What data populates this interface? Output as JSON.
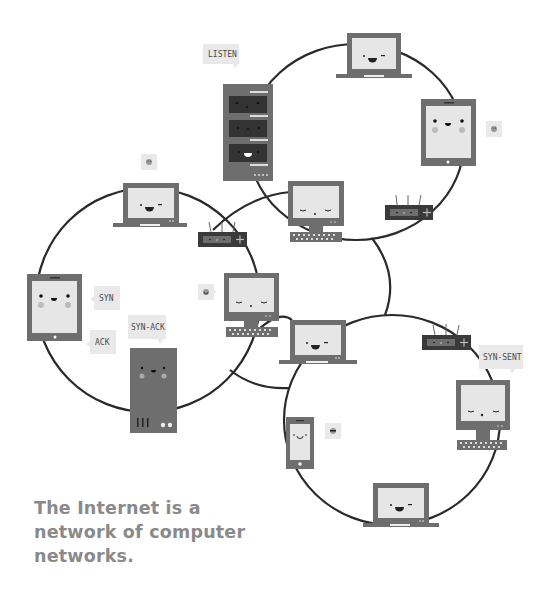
{
  "caption": {
    "lines": [
      "The Internet is a",
      "network of computer",
      "networks."
    ]
  },
  "labels": {
    "listen": "LISTEN",
    "syn": "SYN",
    "ack": "ACK",
    "syn_ack": "SYN-ACK",
    "syn_sent": "SYN-SENT"
  },
  "colors": {
    "device_body": "#6e6e6e",
    "screen": "#e6e6e6",
    "dark": "#3a3a3a",
    "line": "#2a2a2a",
    "bubble": "#e9e9e9",
    "cheek": "#b9b9b9",
    "text": "#8a8a8a"
  },
  "networks": [
    {
      "name": "top-network",
      "devices": [
        "server-rack",
        "laptop",
        "tablet",
        "router",
        "desktop"
      ]
    },
    {
      "name": "left-network",
      "devices": [
        "laptop",
        "tablet",
        "server-tower",
        "router",
        "desktop"
      ]
    },
    {
      "name": "bottom-network",
      "devices": [
        "laptop",
        "phone",
        "router",
        "desktop",
        "laptop"
      ]
    }
  ]
}
